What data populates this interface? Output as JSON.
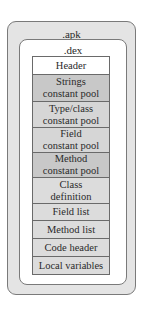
{
  "diagram": {
    "outer_container": {
      "label": ".apk",
      "fill": "#e4e4e4"
    },
    "inner_container": {
      "label": ".dex",
      "fill": "#ffffff"
    },
    "sections": [
      {
        "label": "Header",
        "fill": "#ffffff"
      },
      {
        "label": "Strings constant pool",
        "line1": "Strings",
        "line2": "constant pool",
        "fill": "#c8c8c8"
      },
      {
        "label": "Type/class constant pool",
        "line1": "Type/class",
        "line2": "constant pool",
        "fill": "#d6d6d6"
      },
      {
        "label": "Field constant pool",
        "line1": "Field",
        "line2": "constant pool",
        "fill": "#d6d6d6"
      },
      {
        "label": "Method constant pool",
        "line1": "Method",
        "line2": "constant pool",
        "fill": "#c8c8c8"
      },
      {
        "label": "Class definition",
        "line1": "Class",
        "line2": "definition",
        "fill": "#dcdcdc"
      },
      {
        "label": "Field list",
        "fill": "#dcdcdc"
      },
      {
        "label": "Method list",
        "fill": "#dcdcdc"
      },
      {
        "label": "Code header",
        "fill": "#dcdcdc"
      },
      {
        "label": "Local variables",
        "fill": "#dcdcdc"
      }
    ]
  }
}
